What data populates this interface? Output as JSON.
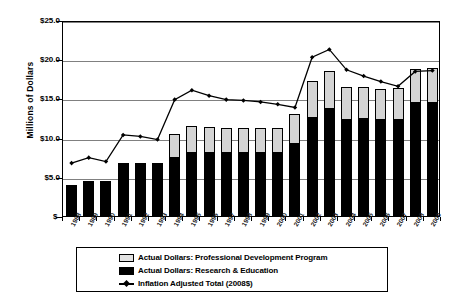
{
  "chart_data": {
    "type": "bar",
    "title": "",
    "subtitle": "",
    "xlabel": "",
    "ylabel": "Millions of Dollars",
    "ylim": [
      0,
      25
    ],
    "ytick_labels": [
      "$25.0",
      "$20.0",
      "$15.0",
      "$10.0",
      "$5.0",
      "$-"
    ],
    "ytick_values": [
      25,
      20,
      15,
      10,
      5,
      0
    ],
    "grid": true,
    "legend_position": "bottom",
    "stacked": true,
    "categories": [
      "1988",
      "1989",
      "1990",
      "1991",
      "1992",
      "1993",
      "1994",
      "1995",
      "1996",
      "1997",
      "1998",
      "1999",
      "2000",
      "2001",
      "2002",
      "2003",
      "2004",
      "2005",
      "2006",
      "2007",
      "2008",
      "2009"
    ],
    "series": [
      {
        "name": "Actual Dollars: Research & Education",
        "type": "bar",
        "color": "#000000",
        "values": [
          4.0,
          4.5,
          4.5,
          6.7,
          6.7,
          6.7,
          7.4,
          8.1,
          8.1,
          8.0,
          8.0,
          8.0,
          8.0,
          9.2,
          12.5,
          13.6,
          12.2,
          12.4,
          12.2,
          12.3,
          14.4,
          14.4
        ]
      },
      {
        "name": "Actual Dollars: Professional Development Program",
        "type": "bar",
        "color": "#D4D4D4",
        "values": [
          0.0,
          0.0,
          0.0,
          0.0,
          0.0,
          0.0,
          3.0,
          3.4,
          3.3,
          3.2,
          3.2,
          3.2,
          3.2,
          3.8,
          4.7,
          4.9,
          4.3,
          4.0,
          4.0,
          4.0,
          4.4,
          4.5
        ]
      },
      {
        "name": "Inflation Adjusted Total (2008$)",
        "type": "line",
        "color": "#000000",
        "values": [
          7.0,
          7.7,
          7.2,
          10.6,
          10.4,
          10.0,
          15.1,
          16.3,
          15.6,
          15.1,
          15.0,
          14.8,
          14.5,
          14.1,
          20.5,
          21.5,
          18.9,
          18.1,
          17.4,
          16.8,
          18.7,
          18.8
        ]
      }
    ],
    "legend": [
      {
        "key": "grey-swatch",
        "label": "Actual Dollars: Professional Development Program"
      },
      {
        "key": "black-swatch",
        "label": "Actual Dollars: Research & Education"
      },
      {
        "key": "line-marker",
        "label": "Inflation Adjusted Total (2008$)"
      }
    ]
  }
}
